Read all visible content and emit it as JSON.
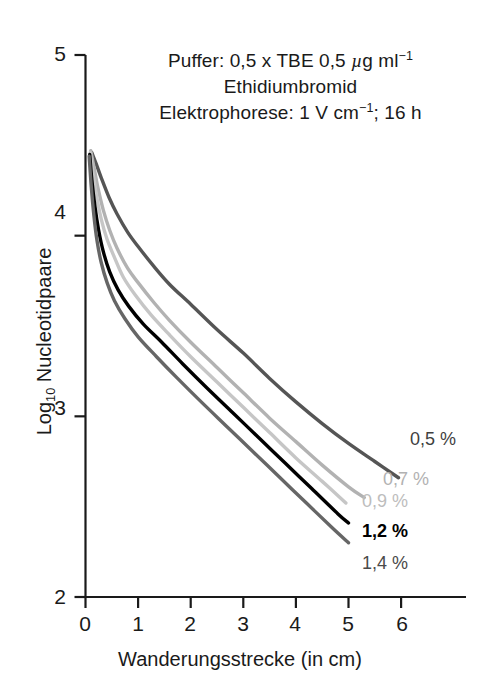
{
  "chart_data": {
    "type": "line",
    "title": "",
    "xlabel": "Wanderungsstrecke (in cm)",
    "ylabel": "Log10 Nucleotidpaare",
    "ylabel_base": "Log",
    "ylabel_sub": "10",
    "ylabel_rest": " Nucleotidpaare",
    "xlim": [
      0,
      6.6
    ],
    "ylim": [
      2,
      5
    ],
    "xticks": [
      "0",
      "1",
      "2",
      "3",
      "4",
      "5",
      "6"
    ],
    "xtick_values": [
      0,
      1,
      2,
      3,
      4,
      5,
      6
    ],
    "yticks": [
      "5",
      "4",
      "3",
      "2"
    ],
    "ytick_values": [
      5,
      4,
      3,
      2
    ],
    "grid": false,
    "legend_position": "right-inline-end-of-curve",
    "annotations": [
      "Puffer: 0,5 x TBE 0,5 µg ml⁻¹",
      "Ethidiumbromid",
      "Elektrophorese: 1 V cm⁻¹; 16 h"
    ],
    "annotation_parts": {
      "line1_a": "Puffer: 0,5 x TBE 0,5 ",
      "line1_mu": "µ",
      "line1_b": "g ml",
      "line1_sup": "−1",
      "line2": "Ethidiumbromid",
      "line3_a": "Elektrophorese: 1 V cm",
      "line3_sup": "−1",
      "line3_b": "; 16 h"
    },
    "series": [
      {
        "name": "0,5 %",
        "label": "0,5 %",
        "color": "#555555",
        "label_color": "#3f3f3f",
        "points": [
          [
            0.12,
            4.46
          ],
          [
            0.2,
            4.4
          ],
          [
            0.3,
            4.32
          ],
          [
            0.45,
            4.21
          ],
          [
            0.6,
            4.12
          ],
          [
            0.8,
            4.02
          ],
          [
            1.0,
            3.94
          ],
          [
            1.3,
            3.83
          ],
          [
            1.6,
            3.73
          ],
          [
            2.0,
            3.62
          ],
          [
            2.5,
            3.48
          ],
          [
            3.0,
            3.35
          ],
          [
            3.5,
            3.21
          ],
          [
            4.0,
            3.08
          ],
          [
            4.5,
            2.96
          ],
          [
            5.0,
            2.85
          ],
          [
            5.5,
            2.75
          ],
          [
            5.95,
            2.66
          ]
        ]
      },
      {
        "name": "0,7 %",
        "label": "0,7 %",
        "color": "#b2b2b2",
        "label_color": "#b2b2b2",
        "points": [
          [
            0.1,
            4.47
          ],
          [
            0.16,
            4.38
          ],
          [
            0.24,
            4.26
          ],
          [
            0.34,
            4.14
          ],
          [
            0.46,
            4.03
          ],
          [
            0.6,
            3.93
          ],
          [
            0.8,
            3.82
          ],
          [
            1.0,
            3.74
          ],
          [
            1.3,
            3.63
          ],
          [
            1.6,
            3.53
          ],
          [
            2.0,
            3.41
          ],
          [
            2.5,
            3.27
          ],
          [
            3.0,
            3.13
          ],
          [
            3.5,
            2.99
          ],
          [
            4.0,
            2.86
          ],
          [
            4.5,
            2.73
          ],
          [
            5.0,
            2.61
          ],
          [
            5.3,
            2.55
          ]
        ]
      },
      {
        "name": "0,9 %",
        "label": "0,9 %",
        "color": "#c6c6c6",
        "label_color": "#bdbdbd",
        "points": [
          [
            0.09,
            4.46
          ],
          [
            0.14,
            4.35
          ],
          [
            0.21,
            4.22
          ],
          [
            0.3,
            4.09
          ],
          [
            0.41,
            3.98
          ],
          [
            0.55,
            3.88
          ],
          [
            0.72,
            3.77
          ],
          [
            0.95,
            3.67
          ],
          [
            1.25,
            3.56
          ],
          [
            1.6,
            3.45
          ],
          [
            2.0,
            3.33
          ],
          [
            2.5,
            3.19
          ],
          [
            3.0,
            3.05
          ],
          [
            3.5,
            2.91
          ],
          [
            4.0,
            2.77
          ],
          [
            4.5,
            2.64
          ],
          [
            4.95,
            2.52
          ]
        ]
      },
      {
        "name": "1,2 %",
        "label": "1,2 %",
        "color": "#000000",
        "label_color": "#000000",
        "points": [
          [
            0.08,
            4.45
          ],
          [
            0.12,
            4.31
          ],
          [
            0.18,
            4.16
          ],
          [
            0.25,
            4.03
          ],
          [
            0.34,
            3.91
          ],
          [
            0.46,
            3.8
          ],
          [
            0.62,
            3.7
          ],
          [
            0.82,
            3.61
          ],
          [
            1.1,
            3.51
          ],
          [
            1.45,
            3.41
          ],
          [
            1.85,
            3.29
          ],
          [
            2.3,
            3.16
          ],
          [
            2.8,
            3.02
          ],
          [
            3.3,
            2.88
          ],
          [
            3.8,
            2.74
          ],
          [
            4.3,
            2.6
          ],
          [
            4.8,
            2.46
          ],
          [
            5.0,
            2.41
          ]
        ]
      },
      {
        "name": "1,4 %",
        "label": "1,4 %",
        "color": "#666666",
        "label_color": "#4a4a4a",
        "points": [
          [
            0.07,
            4.44
          ],
          [
            0.11,
            4.27
          ],
          [
            0.16,
            4.11
          ],
          [
            0.22,
            3.97
          ],
          [
            0.3,
            3.85
          ],
          [
            0.41,
            3.74
          ],
          [
            0.55,
            3.64
          ],
          [
            0.75,
            3.54
          ],
          [
            1.0,
            3.44
          ],
          [
            1.35,
            3.33
          ],
          [
            1.75,
            3.21
          ],
          [
            2.2,
            3.08
          ],
          [
            2.7,
            2.94
          ],
          [
            3.2,
            2.8
          ],
          [
            3.7,
            2.66
          ],
          [
            4.2,
            2.52
          ],
          [
            4.7,
            2.38
          ],
          [
            5.0,
            2.3
          ]
        ]
      }
    ]
  },
  "curve_labels": [
    {
      "text": "0,5 %",
      "x": 410,
      "y": 429,
      "color": "#3f3f3f",
      "weight": "400"
    },
    {
      "text": "0,7 %",
      "x": 383,
      "y": 469,
      "color": "#b2b2b2",
      "weight": "400"
    },
    {
      "text": "0,9 %",
      "x": 362,
      "y": 491,
      "color": "#bdbdbd",
      "weight": "400"
    },
    {
      "text": "1,2 %",
      "x": 362,
      "y": 521,
      "color": "#000000",
      "weight": "700"
    },
    {
      "text": "1,4 %",
      "x": 362,
      "y": 553,
      "color": "#4a4a4a",
      "weight": "400"
    }
  ],
  "axis": {
    "ytick_positions": [
      {
        "label": "5",
        "top": 42
      },
      {
        "label": "4",
        "top": 200
      },
      {
        "label": "3",
        "top": 396
      },
      {
        "label": "2",
        "top": 585
      }
    ],
    "xtick_positions": [
      {
        "label": "0",
        "left": 72
      },
      {
        "label": "1",
        "left": 125
      },
      {
        "label": "2",
        "left": 177
      },
      {
        "label": "3",
        "left": 230
      },
      {
        "label": "4",
        "left": 282
      },
      {
        "label": "5",
        "left": 335
      },
      {
        "label": "6",
        "left": 389
      }
    ]
  }
}
